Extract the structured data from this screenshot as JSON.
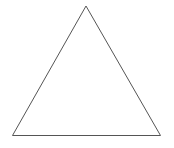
{
  "diagram": {
    "background": "#ffffff",
    "shapes": [
      {
        "type": "triangle",
        "name": "triangle-outline",
        "points": [
          [
            86,
            6
          ],
          [
            12.5,
            135.5
          ],
          [
            160.5,
            135.5
          ]
        ],
        "stroke": "#555555",
        "stroke_width": 1,
        "fill": "none"
      }
    ]
  }
}
